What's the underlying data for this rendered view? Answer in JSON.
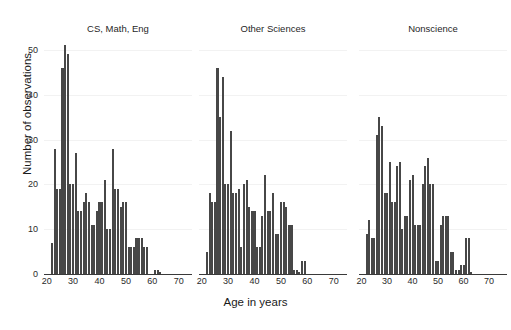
{
  "cropped_header_text": "",
  "axes": {
    "y_label": "Number of observations",
    "x_label": "Age in years",
    "y_ticks": [
      0,
      10,
      20,
      30,
      40,
      50
    ],
    "x_ticks": [
      20,
      30,
      40,
      50,
      60,
      70
    ],
    "ylim": [
      0,
      52
    ],
    "xlim": [
      19,
      76
    ]
  },
  "style": {
    "bar_color": "#474747",
    "axis_color": "#3a3a3a",
    "grid_color": "#f2f2f2",
    "background": "#ffffff"
  },
  "chart_data": {
    "type": "bar",
    "title": "",
    "xlabel": "Age in years",
    "ylabel": "Number of observations",
    "ylim": [
      0,
      52
    ],
    "grid": true,
    "legend": "none",
    "panels": [
      {
        "title": "CS, Math, Eng",
        "xlim": [
          19,
          75
        ],
        "x": [
          22,
          23,
          24,
          25,
          26,
          27,
          28,
          29,
          30,
          31,
          32,
          33,
          34,
          35,
          36,
          37,
          38,
          39,
          40,
          41,
          42,
          43,
          44,
          45,
          46,
          47,
          48,
          49,
          50,
          51,
          52,
          53,
          54,
          55,
          56,
          57,
          58,
          59,
          60,
          61,
          62,
          63,
          64,
          65,
          66,
          67,
          68,
          69,
          70,
          71,
          72,
          73
        ],
        "values": [
          7,
          28,
          19,
          19,
          46,
          51,
          49,
          20,
          20,
          27,
          14,
          14,
          16,
          18,
          16,
          11,
          11,
          14,
          16,
          16,
          21,
          10,
          10,
          28,
          19,
          19,
          15,
          16,
          16,
          6,
          6,
          6,
          8,
          8,
          8,
          6,
          6,
          0,
          0,
          1,
          1,
          0.5,
          0,
          0,
          0,
          0,
          0,
          0,
          0,
          0,
          0,
          0
        ]
      },
      {
        "title": "Other Sciences",
        "xlim": [
          19,
          75
        ],
        "x": [
          22,
          23,
          24,
          25,
          26,
          27,
          28,
          29,
          30,
          31,
          32,
          33,
          34,
          35,
          36,
          37,
          38,
          39,
          40,
          41,
          42,
          43,
          44,
          45,
          46,
          47,
          48,
          49,
          50,
          51,
          52,
          53,
          54,
          55,
          56,
          57,
          58,
          59,
          60,
          61,
          62,
          63,
          64,
          65,
          66,
          67,
          68,
          69,
          70,
          71,
          72,
          73
        ],
        "values": [
          5,
          18,
          16,
          16,
          46,
          35,
          44,
          20,
          20,
          32,
          18,
          18,
          19,
          6,
          20,
          21,
          15,
          14,
          14,
          6,
          6,
          13,
          22,
          14,
          14,
          18,
          9,
          9,
          16,
          16,
          15,
          11,
          11,
          1,
          1,
          0.5,
          3,
          3,
          0,
          0,
          0,
          0,
          0,
          0,
          0,
          0,
          0,
          0,
          0,
          0,
          0,
          0
        ]
      },
      {
        "title": "Nonscience",
        "xlim": [
          19,
          77
        ],
        "x": [
          22,
          23,
          24,
          25,
          26,
          27,
          28,
          29,
          30,
          31,
          32,
          33,
          34,
          35,
          36,
          37,
          38,
          39,
          40,
          41,
          42,
          43,
          44,
          45,
          46,
          47,
          48,
          49,
          50,
          51,
          52,
          53,
          54,
          55,
          56,
          57,
          58,
          59,
          60,
          61,
          62,
          63,
          64,
          65,
          66,
          67,
          68,
          69,
          70,
          71,
          72,
          73,
          74,
          75
        ],
        "values": [
          9,
          12,
          8,
          8,
          31,
          35,
          33,
          18,
          18,
          25,
          16,
          16,
          24,
          25,
          10,
          13,
          13,
          21,
          22,
          11,
          11,
          11,
          20,
          24,
          26,
          20,
          20,
          3,
          3,
          11,
          13,
          13,
          13,
          5,
          5,
          1,
          1,
          2,
          2,
          8,
          8,
          0.5,
          0,
          0,
          0,
          0,
          0,
          0,
          0,
          0,
          0,
          0,
          0,
          0
        ]
      }
    ]
  }
}
